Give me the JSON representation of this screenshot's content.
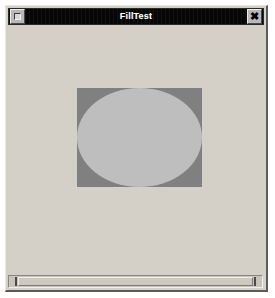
{
  "window": {
    "title": "FillTest",
    "background_color": "#d4d0c8",
    "titlebar_color": "#070707",
    "titlebar_text_color": "#ffffff",
    "menu_button_icon": "window-menu-box-icon",
    "close_button_label": "✖",
    "close_button_icon": "close-x-icon"
  },
  "canvas": {
    "background_color": "#d4d0c8",
    "shapes": [
      {
        "kind": "rectangle",
        "name": "filled-rectangle",
        "fill_color": "#808080",
        "x": 69,
        "y": 61,
        "width": 125,
        "height": 99
      },
      {
        "kind": "ellipse",
        "name": "filled-ellipse",
        "fill_color": "#bebebe",
        "x": 69,
        "y": 61,
        "width": 125,
        "height": 99
      }
    ]
  },
  "scrollbar": {
    "orientation": "horizontal",
    "thumb_color": "#cdc9c1",
    "trough_color": "#c8c4bc",
    "tick_color": "#4a4a4a"
  }
}
